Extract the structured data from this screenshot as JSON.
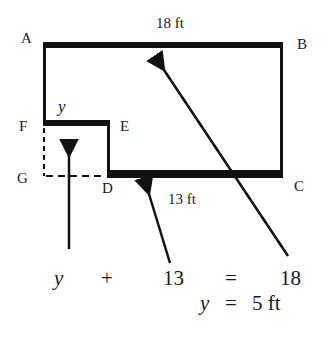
{
  "diagram": {
    "type": "geometry-floor-plan",
    "vertices": {
      "A": "A",
      "B": "B",
      "C": "C",
      "D": "D",
      "E": "E",
      "F": "F",
      "G": "G"
    },
    "dimensions": {
      "top": "18 ft",
      "bottom": "13 ft",
      "unknown": "y"
    },
    "equation": {
      "term1": "y",
      "plus": "+",
      "term2": "13",
      "equals": "=",
      "term3": "18"
    },
    "solution": {
      "var": "y",
      "equals": "=",
      "value": "5 ft"
    },
    "colors": {
      "stroke": "#111111",
      "background": "#ffffff"
    }
  }
}
